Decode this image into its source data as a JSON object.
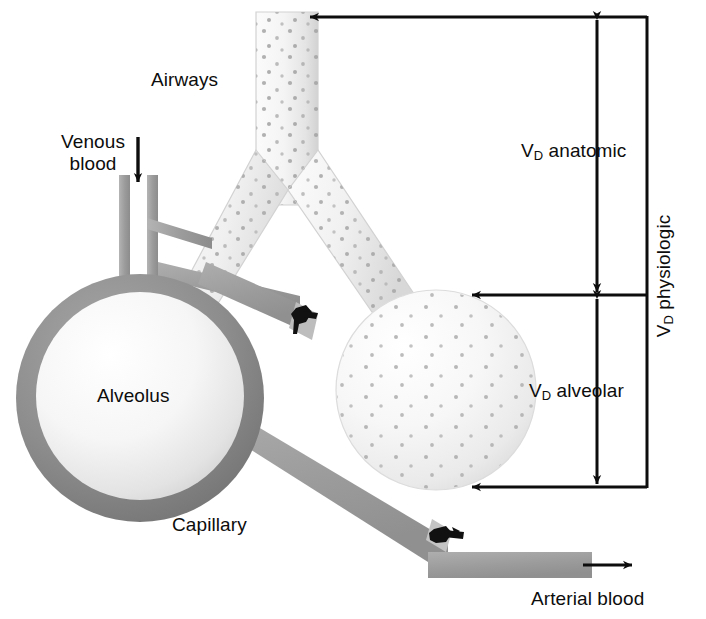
{
  "figure": {
    "background_color": "#ffffff",
    "width": 706,
    "height": 619
  },
  "labels": {
    "airways": "Airways",
    "venous_blood": "Venous blood",
    "alveolus": "Alveolus",
    "capillary": "Capillary",
    "arterial_blood": "Arterial blood",
    "vd_anatomic_v": "V",
    "vd_anatomic_sub": "D",
    "vd_anatomic_rest": " anatomic",
    "vd_alveolar_v": "V",
    "vd_alveolar_sub": "D",
    "vd_alveolar_rest": " alveolar",
    "vd_physiologic_v": "V",
    "vd_physiologic_sub": "D",
    "vd_physiologic_rest": " physiologic"
  },
  "colors": {
    "ink": "#0d0d0d",
    "alveolus_wall": "#8a8a8a",
    "alveolus_wall_dark": "#6f6f6f",
    "vessel_gray": "#9a9a9a",
    "airway_light": "#f2f2f2",
    "airway_edge": "#cfcfcf",
    "dot_gray": "#9d9d9d",
    "clamp_black": "#111111"
  },
  "brackets": {
    "anatomic": {
      "label": "V D anatomic",
      "top_y": 17,
      "bottom_y": 295,
      "axis_x": 597
    },
    "alveolar": {
      "label": "V D alveolar",
      "top_y": 295,
      "bottom_y": 487,
      "axis_x": 597
    },
    "physiologic": {
      "label": "V D physiologic",
      "top_y": 17,
      "bottom_y": 487,
      "axis_x": 647
    }
  },
  "arrows": {
    "venous_inflow_direction": "down",
    "arterial_outflow_direction": "right",
    "anatomic_top_pointer_direction": "left",
    "alveolar_mid_pointer_direction": "left",
    "alveolar_bottom_pointer_direction": "left"
  },
  "icons": {
    "venous_arrow": "arrow-down-icon",
    "arterial_arrow": "arrow-right-icon",
    "clamp_upper": "vessel-clamp-icon",
    "clamp_lower": "vessel-clamp-icon"
  }
}
